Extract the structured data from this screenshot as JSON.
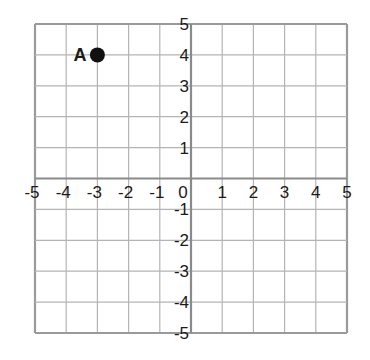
{
  "chart_data": {
    "type": "scatter",
    "title": "",
    "xlabel": "",
    "ylabel": "",
    "xlim": [
      -5,
      5
    ],
    "ylim": [
      -5,
      5
    ],
    "grid": true,
    "grid_step": 1,
    "x_ticks": [
      -5,
      -4,
      -3,
      -2,
      -1,
      0,
      1,
      2,
      3,
      4,
      5
    ],
    "y_ticks": [
      5,
      4,
      3,
      2,
      1,
      -1,
      -2,
      -3,
      -4,
      -5
    ],
    "points": [
      {
        "label": "A",
        "x": -3,
        "y": 4
      }
    ]
  },
  "colors": {
    "grid": "#b4b4b4",
    "axis": "#8a8a8a",
    "border": "#9a9a9a",
    "point": "#111111",
    "text": "#1a1a1a"
  }
}
